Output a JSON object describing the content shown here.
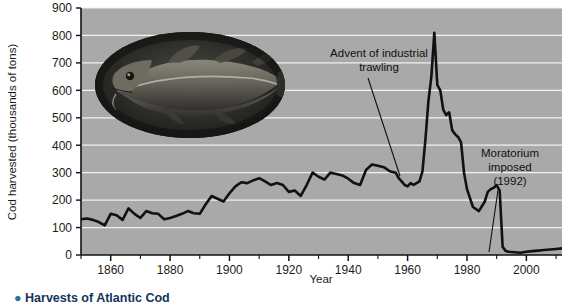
{
  "chart_data": {
    "type": "line",
    "title": "",
    "xlabel": "Year",
    "ylabel": "Cod harvested (thousands of tons)",
    "xlim": [
      1850,
      2012
    ],
    "ylim": [
      0,
      900
    ],
    "xticks": [
      1860,
      1880,
      1900,
      1920,
      1940,
      1960,
      1980,
      2000
    ],
    "xtick_labels": [
      "1860",
      "1880",
      "1900",
      "1920",
      "1940",
      "1960",
      "1980",
      "2000"
    ],
    "yticks": [
      0,
      100,
      200,
      300,
      400,
      500,
      600,
      700,
      800,
      900
    ],
    "ytick_labels": [
      "0",
      "100",
      "200",
      "300",
      "400",
      "500",
      "600",
      "700",
      "800",
      "900"
    ],
    "minor_xtick_interval": 10,
    "grid": "horizontal-white",
    "legend": "none",
    "plot_background": "#a9a9a9",
    "line_color": "#111111",
    "line_width": 2.6,
    "series": [
      {
        "name": "Cod harvested",
        "x": [
          1850,
          1852,
          1854,
          1856,
          1858,
          1860,
          1862,
          1864,
          1866,
          1868,
          1870,
          1872,
          1874,
          1876,
          1878,
          1880,
          1882,
          1884,
          1886,
          1888,
          1890,
          1892,
          1894,
          1896,
          1898,
          1900,
          1902,
          1904,
          1906,
          1908,
          1910,
          1912,
          1914,
          1916,
          1918,
          1920,
          1922,
          1924,
          1926,
          1928,
          1930,
          1932,
          1934,
          1936,
          1938,
          1940,
          1942,
          1944,
          1946,
          1948,
          1950,
          1952,
          1954,
          1956,
          1957,
          1958,
          1959,
          1960,
          1961,
          1962,
          1963,
          1964,
          1965,
          1966,
          1967,
          1968,
          1969,
          1970,
          1971,
          1972,
          1973,
          1974,
          1975,
          1976,
          1977,
          1978,
          1979,
          1980,
          1982,
          1984,
          1986,
          1987,
          1988,
          1989,
          1990,
          1991,
          1992,
          1993,
          1994,
          1996,
          1998,
          2000,
          2002,
          2004,
          2006,
          2008,
          2010,
          2012
        ],
        "y": [
          130,
          133,
          128,
          120,
          108,
          150,
          145,
          128,
          170,
          150,
          135,
          160,
          152,
          150,
          130,
          135,
          142,
          150,
          160,
          152,
          150,
          185,
          215,
          205,
          195,
          225,
          250,
          265,
          262,
          272,
          280,
          268,
          255,
          262,
          255,
          230,
          235,
          215,
          255,
          300,
          285,
          275,
          300,
          295,
          290,
          278,
          262,
          255,
          310,
          330,
          325,
          320,
          305,
          300,
          280,
          268,
          255,
          250,
          262,
          255,
          262,
          268,
          305,
          420,
          560,
          650,
          810,
          620,
          600,
          530,
          510,
          520,
          455,
          440,
          430,
          410,
          300,
          240,
          175,
          160,
          195,
          230,
          240,
          245,
          255,
          235,
          30,
          15,
          12,
          10,
          8,
          12,
          14,
          16,
          18,
          20,
          22,
          24
        ]
      }
    ],
    "annotations": [
      {
        "name": "advent-of-industrial-trawling",
        "lines": [
          "Advent of industrial",
          "trawling"
        ],
        "target_year": 1959,
        "target_value": 255
      },
      {
        "name": "moratorium-imposed",
        "lines": [
          "Moratorium",
          "imposed",
          "(1992)"
        ],
        "target_year": 1992,
        "target_value": 20
      }
    ],
    "inset": {
      "name": "atlantic-cod-photograph",
      "shape": "oval",
      "description": "Photograph of an Atlantic cod"
    }
  },
  "caption": {
    "bullet": "●",
    "text": "Harvests of Atlantic Cod"
  }
}
